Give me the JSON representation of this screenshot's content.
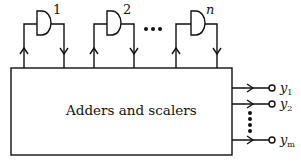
{
  "diagram": {
    "main_block": {
      "label": "Adders and scalers"
    },
    "gates": [
      {
        "label": "1"
      },
      {
        "label": "2"
      },
      {
        "label": "n"
      }
    ],
    "gate_ellipsis": "•••",
    "outputs": [
      {
        "symbol": "y",
        "subscript": "1"
      },
      {
        "symbol": "y",
        "subscript": "2"
      },
      {
        "symbol": "y",
        "subscript": "m"
      }
    ],
    "output_ellipsis": "vertical-dots",
    "colors": {
      "stroke": "#111111",
      "background": "#ffffff"
    }
  }
}
